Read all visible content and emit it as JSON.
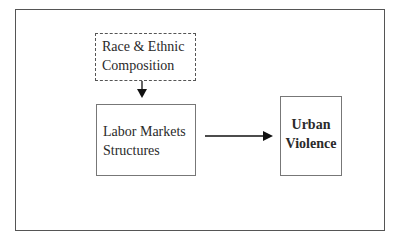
{
  "diagram": {
    "nodes": [
      {
        "id": "race",
        "label_line1": "Race & Ethnic",
        "label_line2": "Composition",
        "style": "dashed"
      },
      {
        "id": "labor",
        "label_line1": "Labor Markets",
        "label_line2": "Structures",
        "style": "solid"
      },
      {
        "id": "urban",
        "label_line1": "Urban",
        "label_line2": "Violence",
        "style": "solid-bold"
      }
    ],
    "edges": [
      {
        "from": "race",
        "to": "labor"
      },
      {
        "from": "labor",
        "to": "urban"
      }
    ]
  }
}
